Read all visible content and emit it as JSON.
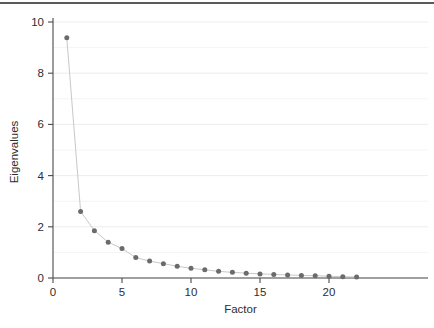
{
  "chart_data": {
    "type": "line",
    "title": "",
    "subtitle": "",
    "xlabel": "Factor",
    "ylabel": "Eigenvalues",
    "x": [
      1,
      2,
      3,
      4,
      5,
      6,
      7,
      8,
      9,
      10,
      11,
      12,
      13,
      14,
      15,
      16,
      17,
      18,
      19,
      20,
      21,
      22
    ],
    "values": [
      9.38,
      2.6,
      1.85,
      1.4,
      1.15,
      0.8,
      0.66,
      0.56,
      0.46,
      0.38,
      0.32,
      0.26,
      0.22,
      0.19,
      0.16,
      0.14,
      0.12,
      0.1,
      0.09,
      0.07,
      0.05,
      0.04
    ],
    "series": [
      {
        "name": "Eigenvalues",
        "values": [
          9.38,
          2.6,
          1.85,
          1.4,
          1.15,
          0.8,
          0.66,
          0.56,
          0.46,
          0.38,
          0.32,
          0.26,
          0.22,
          0.19,
          0.16,
          0.14,
          0.12,
          0.1,
          0.09,
          0.07,
          0.05,
          0.04
        ],
        "marker": "circle",
        "marker_color": "#6b6b6b",
        "line_color": "#c8c8c8"
      }
    ],
    "xlim": [
      0,
      22.8
    ],
    "ylim": [
      -0.28,
      10.35
    ],
    "xticks": [
      0,
      5,
      10,
      15,
      20
    ],
    "xtick_labels": [
      "0",
      "5",
      "10",
      "15",
      "20"
    ],
    "yticks": [
      0,
      2,
      4,
      6,
      8,
      10
    ],
    "ytick_labels": [
      "0",
      "2",
      "4",
      "6",
      "8",
      "10"
    ],
    "gridlines_y_major": [
      0,
      1,
      2,
      3,
      4,
      5,
      6,
      7,
      8,
      9,
      10
    ],
    "grid": true,
    "grid_color": "#ebebeb",
    "legend": null,
    "legend_position": "none",
    "axis_color": "#4a4a4a",
    "background": "#ffffff"
  },
  "figure": {
    "top_rule_color": "#5a5a5a"
  }
}
